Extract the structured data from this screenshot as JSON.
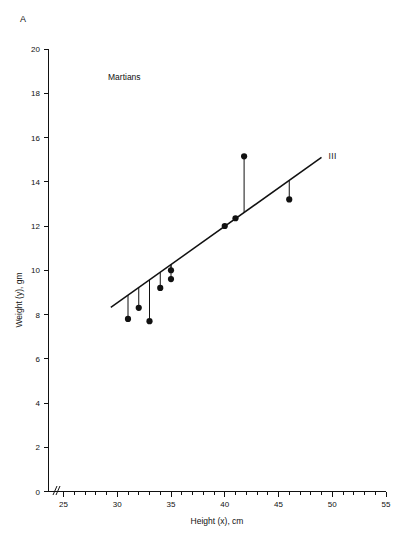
{
  "figure": {
    "panel_label": "A",
    "group_label": "Martians",
    "background_color": "#ffffff",
    "ink_color": "#111111"
  },
  "chart_data": {
    "type": "scatter",
    "title": "",
    "subtitle": "",
    "xlabel": "Height (x), cm",
    "ylabel": "Weight (y), gm",
    "xlim": [
      25,
      55
    ],
    "ylim": [
      0,
      20
    ],
    "x_major_ticks": [
      25,
      30,
      35,
      40,
      45,
      50,
      55
    ],
    "x_tick_labels": [
      "25",
      "30",
      "35",
      "40",
      "45",
      "50",
      "55"
    ],
    "x_minor_tick_step": 1,
    "y_major_ticks": [
      0,
      2,
      4,
      6,
      8,
      10,
      12,
      14,
      16,
      18,
      20
    ],
    "y_tick_labels": [
      "0",
      "2",
      "4",
      "6",
      "8",
      "10",
      "12",
      "14",
      "16",
      "18",
      "20"
    ],
    "grid": false,
    "legend_position": "none",
    "axis_break": {
      "axis": "x",
      "symbol": "//",
      "note": "break between origin and first tick"
    },
    "annotations": [
      {
        "text": "Martians",
        "x": 33.5,
        "y": 18.1
      },
      {
        "text": "A",
        "x": 25.0,
        "y": 20.9
      }
    ],
    "series": [
      {
        "name": "III",
        "label": "III",
        "marker": "filled-circle",
        "marker_color": "#111111",
        "points": [
          {
            "x": 31.0,
            "y": 7.8
          },
          {
            "x": 32.0,
            "y": 8.3
          },
          {
            "x": 33.0,
            "y": 7.7
          },
          {
            "x": 34.0,
            "y": 9.2
          },
          {
            "x": 35.0,
            "y": 10.0
          },
          {
            "x": 35.0,
            "y": 9.6
          },
          {
            "x": 40.0,
            "y": 12.0
          },
          {
            "x": 41.0,
            "y": 12.35
          },
          {
            "x": 41.8,
            "y": 15.15
          },
          {
            "x": 46.0,
            "y": 13.2
          }
        ]
      }
    ],
    "fit_line": {
      "label": "III",
      "x_start": 29.4,
      "y_start": 8.32,
      "x_end": 49.0,
      "y_end": 15.1,
      "slope": 0.346,
      "intercept": -1.85,
      "residual_drops": true
    }
  }
}
